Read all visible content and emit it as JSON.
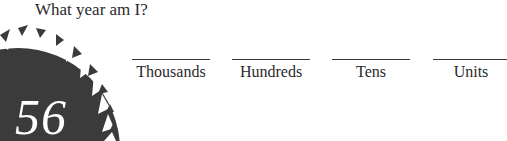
{
  "question": {
    "text": "What year am I?"
  },
  "badge": {
    "number": "56",
    "icon": "serrated-circle-badge",
    "fill_color": "#3b3b3b",
    "text_color": "#ffffff"
  },
  "slots": [
    {
      "label": "Thousands",
      "value": ""
    },
    {
      "label": "Hundreds",
      "value": ""
    },
    {
      "label": "Tens",
      "value": ""
    },
    {
      "label": "Units",
      "value": ""
    }
  ]
}
